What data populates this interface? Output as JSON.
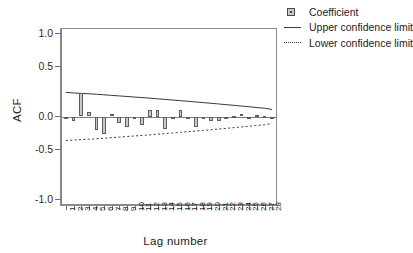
{
  "caption_sliver": "",
  "axes": {
    "y_title": "ACF",
    "x_title": "Lag number",
    "y_ticks": [
      "1.0",
      "0.5",
      "0.0",
      "-0.5",
      "-1.0"
    ],
    "x_ticks": [
      "1",
      "2",
      "3",
      "4",
      "5",
      "6",
      "7",
      "8",
      "9",
      "10",
      "11",
      "12",
      "13",
      "14",
      "15",
      "16",
      "17",
      "18",
      "19",
      "20",
      "21",
      "22",
      "23",
      "24",
      "25",
      "26",
      "27",
      "28"
    ]
  },
  "legend": {
    "items": [
      {
        "key": "bar-swatch",
        "label": "Coefficient"
      },
      {
        "key": "solid-line",
        "label": "Upper confidence limit"
      },
      {
        "key": "dotted-line",
        "label": "Lower confidence limit"
      }
    ]
  },
  "colors": {
    "bar_fill": "#c9c9c9",
    "bar_stroke": "#5d5d5d",
    "line": "#3a3a3a",
    "axis": "#8a8a8a",
    "text": "#1c1c1c"
  },
  "chart_data": {
    "type": "bar",
    "title": "",
    "subtitle": "",
    "xlabel": "Lag number",
    "ylabel": "ACF",
    "ylim": [
      -1.25,
      1.25
    ],
    "ytick_values": [
      1.0,
      0.5,
      0.0,
      -0.5,
      -1.0
    ],
    "grid": false,
    "legend_position": "top-right",
    "categories": [
      1,
      2,
      3,
      4,
      5,
      6,
      7,
      8,
      9,
      10,
      11,
      12,
      13,
      14,
      15,
      16,
      17,
      18,
      19,
      20,
      21,
      22,
      23,
      24,
      25,
      26,
      27,
      28
    ],
    "values": [
      -0.03,
      -0.07,
      0.33,
      0.06,
      -0.19,
      -0.25,
      0.04,
      -0.09,
      -0.15,
      -0.02,
      -0.12,
      0.1,
      0.1,
      -0.18,
      -0.01,
      0.1,
      -0.01,
      -0.15,
      -0.04,
      -0.07,
      -0.07,
      -0.04,
      0.01,
      0.03,
      -0.01,
      0.02,
      0.01,
      -0.005
    ],
    "series": [
      {
        "name": "Coefficient",
        "type": "bar",
        "values": [
          -0.03,
          -0.07,
          0.33,
          0.06,
          -0.19,
          -0.25,
          0.04,
          -0.09,
          -0.15,
          -0.02,
          -0.12,
          0.1,
          0.1,
          -0.18,
          -0.01,
          0.1,
          -0.01,
          -0.15,
          -0.04,
          -0.07,
          -0.07,
          -0.04,
          0.01,
          0.03,
          -0.01,
          0.02,
          0.01,
          -0.005
        ]
      },
      {
        "name": "Upper confidence limit",
        "type": "line",
        "values": [
          0.345,
          0.336,
          0.33,
          0.325,
          0.318,
          0.31,
          0.302,
          0.294,
          0.286,
          0.278,
          0.27,
          0.262,
          0.253,
          0.244,
          0.235,
          0.226,
          0.217,
          0.208,
          0.198,
          0.189,
          0.179,
          0.169,
          0.159,
          0.149,
          0.139,
          0.128,
          0.118,
          0.1
        ]
      },
      {
        "name": "Lower confidence limit",
        "type": "line",
        "values": [
          -0.345,
          -0.336,
          -0.33,
          -0.325,
          -0.318,
          -0.31,
          -0.302,
          -0.294,
          -0.286,
          -0.278,
          -0.27,
          -0.262,
          -0.253,
          -0.244,
          -0.235,
          -0.226,
          -0.217,
          -0.208,
          -0.198,
          -0.189,
          -0.179,
          -0.169,
          -0.159,
          -0.149,
          -0.139,
          -0.128,
          -0.118,
          -0.1
        ]
      }
    ]
  }
}
